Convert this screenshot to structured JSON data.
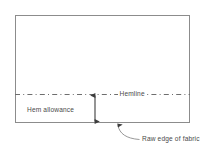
{
  "diagram": {
    "labels": {
      "hemline": "Hemline",
      "hem_allowance": "Hem allowance",
      "raw_edge": "Raw edge of fabric"
    },
    "colors": {
      "outline": "#8c8c8c",
      "hemline": "#6e6e6e",
      "arrow": "#3d3d3d",
      "leader": "#8c8c8c",
      "text": "#4a4a4a",
      "background": "#ffffff"
    },
    "shapes": {
      "fabric_rect": {
        "x": 15,
        "y": 15,
        "width": 175,
        "height": 108
      },
      "hemline_y": 94,
      "allowance_arrow_x": 95,
      "leader_arrow_tip": {
        "x": 118,
        "y": 124
      }
    }
  }
}
